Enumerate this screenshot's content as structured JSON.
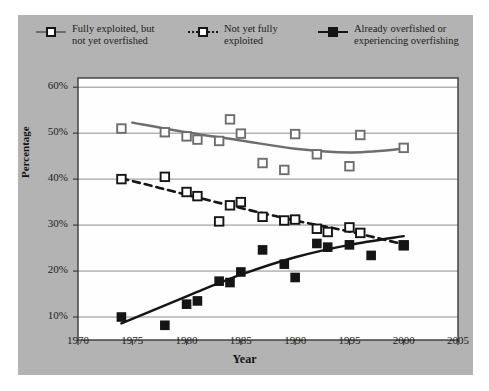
{
  "figure": {
    "background": "#b3b3b3",
    "plot_background": "#fefefe",
    "border_color": "#3a3a3a"
  },
  "legend": {
    "position": "top",
    "entries": [
      {
        "label": "Fully exploited, but\nnot yet overfished",
        "marker": "hollow-square",
        "line": "solid",
        "color": "#6e6e6e",
        "name": "legend-fully-exploited"
      },
      {
        "label": "Not yet fully\nexploited",
        "marker": "hollow-square",
        "line": "dashed",
        "color": "#151515",
        "name": "legend-not-yet-fully-exploited"
      },
      {
        "label": "Already overfished or\nexperiencing overfishing",
        "marker": "filled-square",
        "line": "solid",
        "color": "#151515",
        "name": "legend-already-overfished"
      }
    ]
  },
  "chart_data": {
    "type": "scatter",
    "title": "",
    "xlabel": "Year",
    "ylabel": "Percentage",
    "xlim": [
      1970,
      2005
    ],
    "ylim": [
      5,
      62
    ],
    "xticks": [
      1970,
      1975,
      1980,
      1985,
      1990,
      1995,
      2000,
      2005
    ],
    "yticks": [
      10,
      20,
      30,
      40,
      50,
      60
    ],
    "ytick_labels": [
      "10%",
      "20%",
      "30%",
      "40%",
      "50%",
      "60%"
    ],
    "grid": "horizontal",
    "legend_position": "top",
    "series": [
      {
        "name": "Fully exploited, but not yet overfished",
        "marker": "hollow-square",
        "line": "solid",
        "color": "#6e6e6e",
        "points": [
          {
            "x": 1974,
            "y": 51.0
          },
          {
            "x": 1978,
            "y": 50.2
          },
          {
            "x": 1980,
            "y": 49.3
          },
          {
            "x": 1981,
            "y": 48.6
          },
          {
            "x": 1983,
            "y": 48.3
          },
          {
            "x": 1984,
            "y": 53.0
          },
          {
            "x": 1985,
            "y": 49.9
          },
          {
            "x": 1987,
            "y": 43.5
          },
          {
            "x": 1989,
            "y": 42.0
          },
          {
            "x": 1990,
            "y": 49.8
          },
          {
            "x": 1992,
            "y": 45.4
          },
          {
            "x": 1995,
            "y": 42.8
          },
          {
            "x": 1996,
            "y": 49.6
          },
          {
            "x": 2000,
            "y": 46.8
          }
        ],
        "trend": [
          {
            "x": 1975,
            "y": 52.3
          },
          {
            "x": 1980,
            "y": 50.2
          },
          {
            "x": 1985,
            "y": 48.4
          },
          {
            "x": 1990,
            "y": 46.6
          },
          {
            "x": 1995,
            "y": 45.8
          },
          {
            "x": 2000,
            "y": 46.6
          }
        ]
      },
      {
        "name": "Not yet fully exploited",
        "marker": "hollow-square",
        "line": "dashed",
        "color": "#151515",
        "points": [
          {
            "x": 1974,
            "y": 40.0
          },
          {
            "x": 1978,
            "y": 40.5
          },
          {
            "x": 1980,
            "y": 37.2
          },
          {
            "x": 1981,
            "y": 36.3
          },
          {
            "x": 1983,
            "y": 30.8
          },
          {
            "x": 1984,
            "y": 34.3
          },
          {
            "x": 1985,
            "y": 35.0
          },
          {
            "x": 1987,
            "y": 31.8
          },
          {
            "x": 1989,
            "y": 31.0
          },
          {
            "x": 1990,
            "y": 31.2
          },
          {
            "x": 1992,
            "y": 29.2
          },
          {
            "x": 1993,
            "y": 28.5
          },
          {
            "x": 1995,
            "y": 29.5
          },
          {
            "x": 1996,
            "y": 28.3
          },
          {
            "x": 2000,
            "y": 25.6
          }
        ],
        "trend": [
          {
            "x": 1974,
            "y": 40.2
          },
          {
            "x": 1980,
            "y": 36.6
          },
          {
            "x": 1985,
            "y": 33.7
          },
          {
            "x": 1990,
            "y": 31.0
          },
          {
            "x": 1995,
            "y": 28.6
          },
          {
            "x": 2000,
            "y": 25.8
          }
        ]
      },
      {
        "name": "Already overfished or experiencing overfishing",
        "marker": "filled-square",
        "line": "solid",
        "color": "#151515",
        "points": [
          {
            "x": 1974,
            "y": 10.0
          },
          {
            "x": 1978,
            "y": 8.2
          },
          {
            "x": 1980,
            "y": 12.8
          },
          {
            "x": 1981,
            "y": 13.5
          },
          {
            "x": 1983,
            "y": 17.8
          },
          {
            "x": 1984,
            "y": 17.5
          },
          {
            "x": 1985,
            "y": 19.8
          },
          {
            "x": 1987,
            "y": 24.6
          },
          {
            "x": 1989,
            "y": 21.5
          },
          {
            "x": 1990,
            "y": 18.6
          },
          {
            "x": 1992,
            "y": 26.0
          },
          {
            "x": 1993,
            "y": 25.2
          },
          {
            "x": 1995,
            "y": 25.7
          },
          {
            "x": 1997,
            "y": 23.4
          },
          {
            "x": 2000,
            "y": 25.6
          }
        ],
        "trend": [
          {
            "x": 1974,
            "y": 8.6
          },
          {
            "x": 1980,
            "y": 14.5
          },
          {
            "x": 1985,
            "y": 19.2
          },
          {
            "x": 1990,
            "y": 23.0
          },
          {
            "x": 1995,
            "y": 25.7
          },
          {
            "x": 2000,
            "y": 27.6
          }
        ]
      }
    ]
  }
}
